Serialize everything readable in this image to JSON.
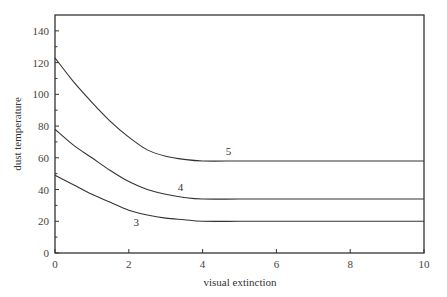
{
  "chart_data": {
    "type": "line",
    "title": "",
    "xlabel": "visual extinction",
    "ylabel": "dust temperature",
    "xlim": [
      0,
      10
    ],
    "ylim": [
      0,
      150
    ],
    "x_ticks": [
      0,
      2,
      4,
      6,
      8,
      10
    ],
    "y_ticks": [
      0,
      20,
      40,
      60,
      80,
      100,
      120,
      140
    ],
    "grid": false,
    "legend": "none (inline curve labels)",
    "x": [
      0,
      0.5,
      1,
      1.5,
      2,
      2.5,
      3,
      3.5,
      4,
      5,
      6,
      7,
      8,
      9,
      10
    ],
    "series": [
      {
        "name": "5",
        "label_pos": {
          "x": 4.7,
          "y": 62
        },
        "values": [
          123,
          108,
          95,
          83,
          73,
          65,
          61,
          59,
          58,
          58,
          58,
          58,
          58,
          58,
          58
        ]
      },
      {
        "name": "4",
        "label_pos": {
          "x": 3.4,
          "y": 39
        },
        "values": [
          78,
          68,
          60,
          52,
          45,
          40,
          37,
          35,
          34,
          34,
          34,
          34,
          34,
          34,
          34
        ]
      },
      {
        "name": "3",
        "label_pos": {
          "x": 2.2,
          "y": 17
        },
        "values": [
          49,
          43,
          37,
          32,
          27,
          24,
          22,
          21,
          20,
          20,
          20,
          20,
          20,
          20,
          20
        ]
      }
    ]
  },
  "labels": {
    "xlabel": "visual extinction",
    "ylabel": "dust temperature"
  }
}
